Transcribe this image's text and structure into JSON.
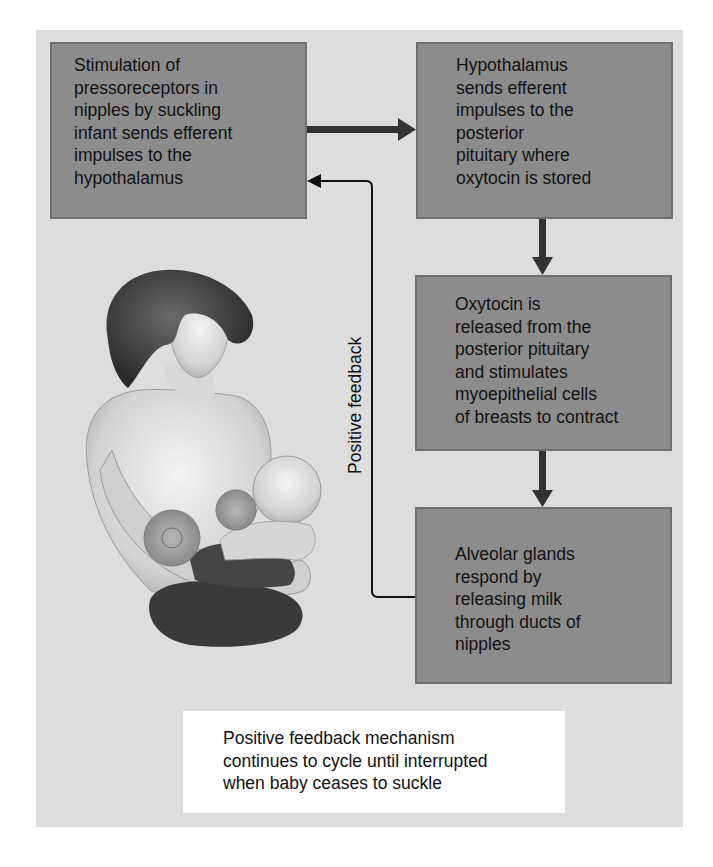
{
  "diagram": {
    "colors": {
      "frame_background": "#dddddd",
      "box_fill": "#8c8c8c",
      "box_border": "#6f6f6f",
      "arrow": "#333333",
      "feedback_line": "#111111",
      "caption_background": "#ffffff",
      "text": "#111111"
    },
    "boxes": [
      {
        "id": "stimulation",
        "text": "Stimulation of\npressoreceptors in\nnipples by suckling\ninfant sends efferent\nimpulses to the\nhypothalamus"
      },
      {
        "id": "hypothalamus",
        "text": "Hypothalamus\nsends efferent\nimpulses to the\nposterior\npituitary where\noxytocin is stored"
      },
      {
        "id": "oxytocin-release",
        "text": "Oxytocin is\nreleased from the\nposterior pituitary\nand stimulates\nmyoepithelial cells\nof breasts to contract"
      },
      {
        "id": "milk-release",
        "text": "Alveolar glands\nrespond by\nreleasing milk\nthrough ducts of\nnipples"
      }
    ],
    "arrows": [
      {
        "from": "stimulation",
        "to": "hypothalamus",
        "style": "thick"
      },
      {
        "from": "hypothalamus",
        "to": "oxytocin-release",
        "style": "thick"
      },
      {
        "from": "oxytocin-release",
        "to": "milk-release",
        "style": "thick"
      },
      {
        "from": "milk-release",
        "to": "stimulation",
        "style": "thin",
        "label": "Positive feedback"
      }
    ],
    "feedback_label": "Positive feedback",
    "caption": "Positive feedback mechanism\ncontinues to cycle until interrupted\nwhen baby ceases to suckle",
    "illustration": "mother-nursing-infant-with-mammary-glands"
  }
}
